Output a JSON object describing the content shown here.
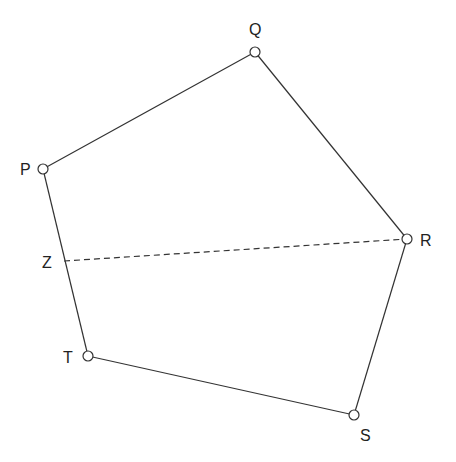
{
  "diagram": {
    "type": "pentagon",
    "stroke_color": "#333333",
    "background": "#ffffff",
    "vertices": [
      {
        "id": "P",
        "label": "P",
        "x": 43,
        "y": 169,
        "lx": 20,
        "ly": 175
      },
      {
        "id": "Q",
        "label": "Q",
        "x": 255,
        "y": 52,
        "lx": 249,
        "ly": 35
      },
      {
        "id": "R",
        "label": "R",
        "x": 407,
        "y": 239,
        "lx": 420,
        "ly": 246
      },
      {
        "id": "S",
        "label": "S",
        "x": 354,
        "y": 415,
        "lx": 360,
        "ly": 441
      },
      {
        "id": "T",
        "label": "T",
        "x": 88,
        "y": 356,
        "lx": 63,
        "ly": 363
      }
    ],
    "edges": [
      [
        "P",
        "Q"
      ],
      [
        "Q",
        "R"
      ],
      [
        "R",
        "S"
      ],
      [
        "S",
        "T"
      ],
      [
        "T",
        "P"
      ]
    ],
    "point_z": {
      "label": "Z",
      "x": 64,
      "y": 261,
      "lx": 42,
      "ly": 268
    },
    "dashed_segment": {
      "from": "Z",
      "to": "R"
    }
  }
}
